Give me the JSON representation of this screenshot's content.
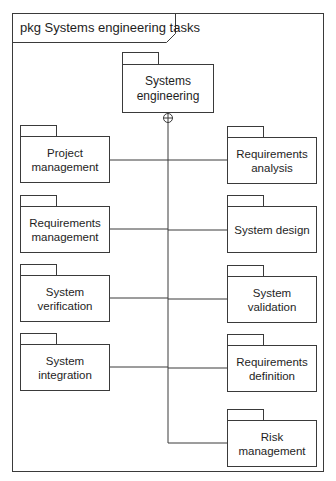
{
  "frame": {
    "kind": "pkg",
    "name": "Systems engineering tasks",
    "label": "pkg Systems engineering tasks"
  },
  "root_package": {
    "name": "Systems engineering",
    "label": "Systems\nengineering",
    "relationship": "containment",
    "relationship_symbol": "circle-plus-icon"
  },
  "left_packages": [
    {
      "name": "Project management",
      "label": "Project\nmanagement"
    },
    {
      "name": "Requirements management",
      "label": "Requirements\nmanagement"
    },
    {
      "name": "System verification",
      "label": "System\nverification"
    },
    {
      "name": "System integration",
      "label": "System\nintegration"
    }
  ],
  "right_packages": [
    {
      "name": "Requirements analysis",
      "label": "Requirements\nanalysis"
    },
    {
      "name": "System design",
      "label": "System design"
    },
    {
      "name": "System validation",
      "label": "System\nvalidation"
    },
    {
      "name": "Requirements definition",
      "label": "Requirements\ndefinition"
    },
    {
      "name": "Risk management",
      "label": "Risk\nmanagement"
    }
  ],
  "colors": {
    "line": "#3a3a3a",
    "text": "#1e1e1e",
    "background": "#ffffff"
  }
}
